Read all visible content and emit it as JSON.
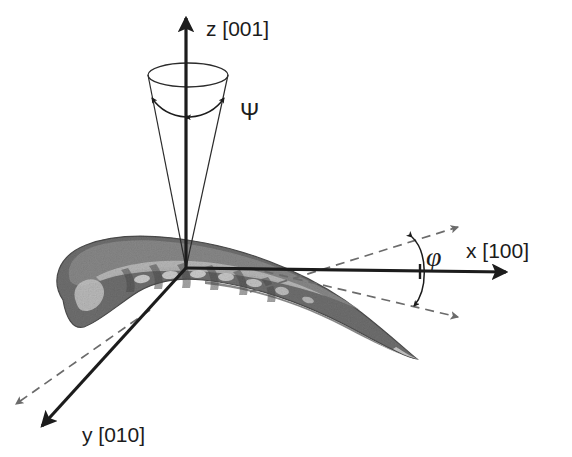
{
  "figure": {
    "kind": "crystallographic-orientation-diagram",
    "background_color": "#ffffff"
  },
  "axes": {
    "z": {
      "label": "z [001]",
      "direction": "up",
      "color": "#1c1c1c",
      "origin": [
        186,
        268
      ],
      "tip": [
        186,
        18
      ],
      "label_pos": [
        206,
        36
      ]
    },
    "x": {
      "label": "x [100]",
      "direction": "right",
      "color": "#1c1c1c",
      "origin": [
        186,
        268
      ],
      "tip": [
        506,
        272
      ],
      "label_pos": [
        466,
        250
      ]
    },
    "y": {
      "label": "y [010]",
      "direction": "lower-left",
      "color": "#1c1c1c",
      "origin": [
        186,
        268
      ],
      "tip": [
        42,
        426
      ],
      "label_pos": [
        82,
        438
      ]
    }
  },
  "angles": {
    "psi": {
      "symbol": "Ψ",
      "label_pos": [
        240,
        118
      ],
      "description": "half-cone spread about the z [001] axis",
      "cone_apex": [
        186,
        268
      ],
      "cone_top_center": [
        188,
        75
      ],
      "cone_top_rx": 40,
      "cone_top_ry": 12,
      "arc_color": "#1c1c1c"
    },
    "phi": {
      "symbol": "φ",
      "label_pos": [
        426,
        258
      ],
      "description": "in-plane rotation about the x [100] axis",
      "vertex_on_x_axis": [
        420,
        271
      ],
      "upper_ray_tip": [
        458,
        227
      ],
      "lower_ray_tip": [
        458,
        317
      ],
      "ray_style": "dashed",
      "ray_color": "#707070"
    },
    "y_dashed": {
      "description": "dashed reference ray parallel to y [010]",
      "tip": [
        16,
        404
      ],
      "style": "dashed",
      "color": "#707070"
    }
  },
  "blade": {
    "name": "turbine-blade-airfoil",
    "fill_dark": "#6e6e6e",
    "fill_mid": "#848484",
    "fill_light": "#b4b4b4",
    "fill_highlight": "#d2d2d2",
    "edge_color": "#4a4a4a",
    "leading_edge": "left-blunt",
    "trailing_edge": "right-thin-tip",
    "span_x": [
      48,
      420
    ],
    "span_y": [
      236,
      360
    ]
  }
}
